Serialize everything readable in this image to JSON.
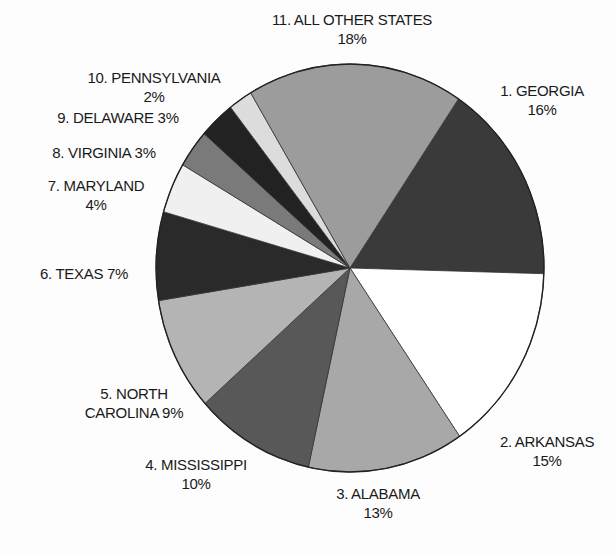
{
  "chart_data": {
    "type": "pie",
    "title": "",
    "start_angle_deg": 34,
    "direction": "clockwise",
    "center": [
      350,
      268
    ],
    "radius": [
      194,
      204
    ],
    "slices": [
      {
        "rank": 1,
        "name": "GEORGIA",
        "value": 16,
        "label": "1. GEORGIA",
        "pct": "16%",
        "color": "#3a3a3a"
      },
      {
        "rank": 2,
        "name": "ARKANSAS",
        "value": 15,
        "label": "2. ARKANSAS",
        "pct": "15%",
        "color": "#ffffff"
      },
      {
        "rank": 3,
        "name": "ALABAMA",
        "value": 13,
        "label": "3. ALABAMA",
        "pct": "13%",
        "color": "#a8a8a8"
      },
      {
        "rank": 4,
        "name": "MISSISSIPPI",
        "value": 10,
        "label": "4. MISSISSIPPI",
        "pct": "10%",
        "color": "#585858"
      },
      {
        "rank": 5,
        "name": "NORTH CAROLINA",
        "value": 9,
        "label": "5. NORTH CAROLINA",
        "pct": "9%",
        "color": "#b4b4b4"
      },
      {
        "rank": 6,
        "name": "TEXAS",
        "value": 7,
        "label": "6. TEXAS",
        "pct": "7%",
        "color": "#2a2a2a"
      },
      {
        "rank": 7,
        "name": "MARYLAND",
        "value": 4,
        "label": "7. MARYLAND",
        "pct": "4%",
        "color": "#f0f0f0"
      },
      {
        "rank": 8,
        "name": "VIRGINIA",
        "value": 3,
        "label": "8. VIRGINIA",
        "pct": "3%",
        "color": "#7a7a7a"
      },
      {
        "rank": 9,
        "name": "DELAWARE",
        "value": 3,
        "label": "9. DELAWARE",
        "pct": "3%",
        "color": "#222222"
      },
      {
        "rank": 10,
        "name": "PENNSYLVANIA",
        "value": 2,
        "label": "10. PENNSYLVANIA",
        "pct": "2%",
        "color": "#dcdcdc"
      },
      {
        "rank": 11,
        "name": "ALL OTHER STATES",
        "value": 18,
        "label": "11. ALL OTHER STATES",
        "pct": "18%",
        "color": "#9c9c9c"
      }
    ]
  },
  "labels": {
    "other": {
      "line1": "11. ALL OTHER STATES",
      "line2": "18%"
    },
    "georgia": {
      "line1": "1. GEORGIA",
      "line2": "16%"
    },
    "pennsylvania": {
      "line1": "10. PENNSYLVANIA",
      "line2": "2%"
    },
    "delaware": {
      "line1": "9. DELAWARE 3%"
    },
    "virginia": {
      "line1": "8. VIRGINIA 3%"
    },
    "maryland": {
      "line1": "7. MARYLAND",
      "line2": "4%"
    },
    "texas": {
      "line1": "6. TEXAS 7%"
    },
    "north_carolina": {
      "line1": "5. NORTH",
      "line2": "CAROLINA 9%"
    },
    "mississippi": {
      "line1": "4. MISSISSIPPI",
      "line2": "10%"
    },
    "alabama": {
      "line1": "3. ALABAMA",
      "line2": "13%"
    },
    "arkansas": {
      "line1": "2. ARKANSAS",
      "line2": "15%"
    }
  }
}
